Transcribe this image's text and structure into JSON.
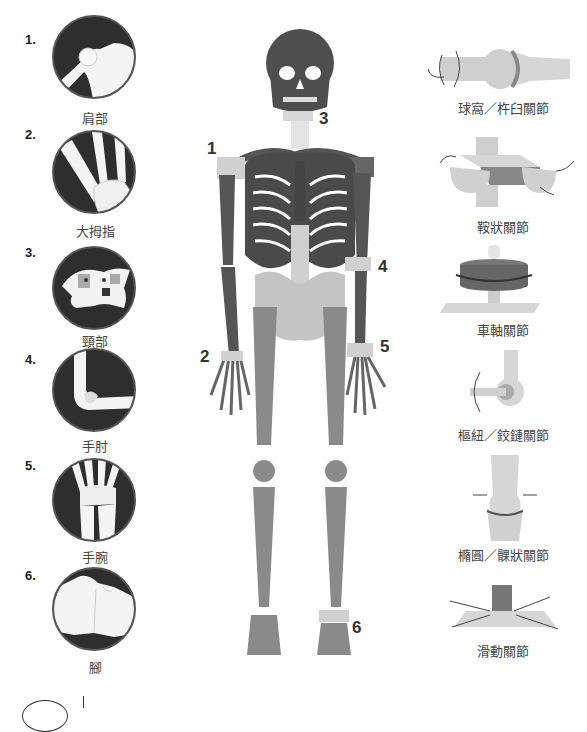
{
  "left_column": {
    "items": [
      {
        "number": "1.",
        "label": "肩部",
        "icon": "shoulder-joint"
      },
      {
        "number": "2.",
        "label": "大拇指",
        "icon": "thumb-joint"
      },
      {
        "number": "3.",
        "label": "頸部",
        "icon": "neck-vertebra"
      },
      {
        "number": "4.",
        "label": "手肘",
        "icon": "elbow-joint"
      },
      {
        "number": "5.",
        "label": "手腕",
        "icon": "wrist-joint"
      },
      {
        "number": "6.",
        "label": "腳",
        "icon": "foot-joint"
      }
    ]
  },
  "skeleton": {
    "markers": [
      {
        "id": "1",
        "label": "1"
      },
      {
        "id": "2",
        "label": "2"
      },
      {
        "id": "3",
        "label": "3"
      },
      {
        "id": "4",
        "label": "4"
      },
      {
        "id": "5",
        "label": "5"
      },
      {
        "id": "6",
        "label": "6"
      }
    ]
  },
  "right_column": {
    "joint_types": [
      {
        "label": "球窩／杵臼關節",
        "icon": "ball-and-socket"
      },
      {
        "label": "鞍狀關節",
        "icon": "saddle"
      },
      {
        "label": "車軸關節",
        "icon": "pivot"
      },
      {
        "label": "樞紐／鉸鏈關節",
        "icon": "hinge"
      },
      {
        "label": "橢圓／髁狀關節",
        "icon": "condyloid"
      },
      {
        "label": "滑動關節",
        "icon": "gliding"
      }
    ]
  },
  "colors": {
    "dark_bone": "#5a5a5a",
    "mid_bone": "#8a8a8a",
    "light_bone": "#c4c4c4",
    "highlight": "#d8d8d8",
    "circle_bg": "#2e2e2e"
  }
}
